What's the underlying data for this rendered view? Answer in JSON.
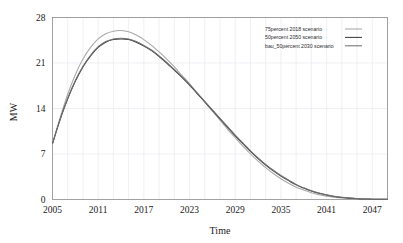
{
  "chart_data": {
    "type": "line",
    "title": "",
    "xlabel": "Time",
    "ylabel": "MW",
    "xlim": [
      2005,
      2049
    ],
    "ylim": [
      0,
      28
    ],
    "xticks": [
      2005,
      2011,
      2017,
      2023,
      2029,
      2035,
      2041,
      2047
    ],
    "yticks": [
      0,
      7,
      14,
      21,
      28
    ],
    "xtick_labels": [
      "2005",
      "2011",
      "2017",
      "2023",
      "2029",
      "2035",
      "2041",
      "2047"
    ],
    "ytick_labels": [
      "0",
      "7",
      "14",
      "21",
      "28"
    ],
    "grid": true,
    "legend_position": "top-right",
    "x": [
      2005,
      2006,
      2007,
      2008,
      2009,
      2010,
      2011,
      2012,
      2013,
      2014,
      2015,
      2016,
      2017,
      2018,
      2019,
      2020,
      2021,
      2022,
      2023,
      2024,
      2025,
      2026,
      2027,
      2028,
      2029,
      2030,
      2031,
      2032,
      2033,
      2034,
      2035,
      2036,
      2037,
      2038,
      2039,
      2040,
      2041,
      2042,
      2043,
      2044,
      2045,
      2046,
      2047,
      2048,
      2049
    ],
    "series": [
      {
        "name": "75percent 2018 scenario",
        "color": "#a8a8a8",
        "values": [
          8.6,
          12.6,
          16.2,
          19.2,
          21.6,
          23.4,
          24.7,
          25.5,
          25.9,
          26.0,
          25.8,
          25.3,
          24.6,
          23.7,
          22.7,
          21.6,
          20.4,
          19.1,
          17.8,
          16.4,
          15.0,
          13.6,
          12.2,
          10.8,
          9.5,
          8.2,
          7.0,
          5.9,
          4.9,
          4.0,
          3.2,
          2.5,
          1.9,
          1.45,
          1.05,
          0.75,
          0.52,
          0.35,
          0.23,
          0.15,
          0.09,
          0.05,
          0.03,
          0.02,
          0.01
        ]
      },
      {
        "name": "50percent 2050 scenario",
        "color": "#3d3d3d",
        "values": [
          8.6,
          12.3,
          15.5,
          18.2,
          20.4,
          22.1,
          23.4,
          24.2,
          24.6,
          24.7,
          24.6,
          24.2,
          23.6,
          22.9,
          22.0,
          21.0,
          19.9,
          18.8,
          17.6,
          16.3,
          15.0,
          13.7,
          12.4,
          11.1,
          9.8,
          8.6,
          7.4,
          6.3,
          5.3,
          4.4,
          3.6,
          2.9,
          2.25,
          1.75,
          1.3,
          0.95,
          0.68,
          0.47,
          0.32,
          0.21,
          0.13,
          0.08,
          0.05,
          0.03,
          0.02
        ]
      },
      {
        "name": "bau_50percent 2030 scenario",
        "color": "#707070",
        "values": [
          8.6,
          12.35,
          15.6,
          18.3,
          20.5,
          22.2,
          23.5,
          24.3,
          24.7,
          24.8,
          24.7,
          24.3,
          23.7,
          23.0,
          22.1,
          21.1,
          20.0,
          18.9,
          17.7,
          16.4,
          15.1,
          13.8,
          12.5,
          11.2,
          9.9,
          8.7,
          7.5,
          6.4,
          5.4,
          4.5,
          3.7,
          3.0,
          2.3,
          1.8,
          1.35,
          1.0,
          0.71,
          0.49,
          0.33,
          0.22,
          0.14,
          0.085,
          0.05,
          0.03,
          0.02
        ]
      }
    ]
  },
  "legend": {
    "entries": [
      {
        "label": "75percent 2018 scenario"
      },
      {
        "label": "50percent 2050 scenario"
      },
      {
        "label": "bau_50percent 2030 scenario"
      }
    ]
  },
  "axes": {
    "y_title": "MW",
    "x_title": "Time"
  }
}
